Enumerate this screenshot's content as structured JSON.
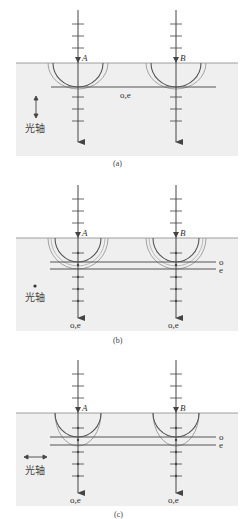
{
  "panels": [
    {
      "id": "a",
      "caption": "(a)",
      "ray_labels": [
        "A",
        "B"
      ],
      "wavefront_label": "o,e",
      "optic_axis_label": "光轴",
      "optic_axis_orientation": "vertical",
      "exit_labels": []
    },
    {
      "id": "b",
      "caption": "(b)",
      "ray_labels": [
        "A",
        "B"
      ],
      "wavefront_labels": [
        "o",
        "e"
      ],
      "optic_axis_label": "光轴",
      "optic_axis_orientation": "perpendicular-dot",
      "exit_labels": [
        "o,e",
        "o,e"
      ]
    },
    {
      "id": "c",
      "caption": "(c)",
      "ray_labels": [
        "A",
        "B"
      ],
      "wavefront_labels": [
        "o",
        "e"
      ],
      "optic_axis_label": "光轴",
      "optic_axis_orientation": "horizontal",
      "exit_labels": [
        "o,e",
        "o,e"
      ]
    }
  ],
  "colors": {
    "crystal_fill": "#efefef",
    "line": "#444444",
    "wave_light": "#999999"
  }
}
